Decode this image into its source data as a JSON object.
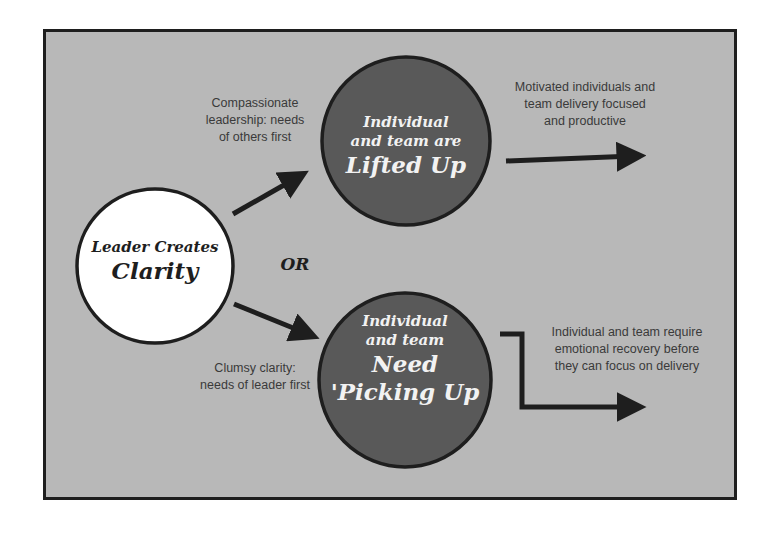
{
  "diagram": {
    "background_color": "#b8b8b8",
    "border_color": "#1e1e1e",
    "node_dark_color": "#5a5a5a",
    "node_light_color": "#ffffff",
    "source_node": {
      "line1": "Leader Creates",
      "line2": "Clarity"
    },
    "separator": "OR",
    "top_branch": {
      "edge_label_line1": "Compassionate",
      "edge_label_line2": "leadership: needs",
      "edge_label_line3": "of others first",
      "node_line1": "Individual",
      "node_line2": "and team are",
      "node_line3": "Lifted Up",
      "outcome_line1": "Motivated individuals and",
      "outcome_line2": "team delivery focused",
      "outcome_line3": "and productive"
    },
    "bottom_branch": {
      "edge_label_line1": "Clumsy clarity:",
      "edge_label_line2": "needs of leader first",
      "node_line1": "Individual",
      "node_line2": "and team",
      "node_line3": "Need",
      "node_line4": "'Picking Up",
      "outcome_line1": "Individual and team require",
      "outcome_line2": "emotional recovery before",
      "outcome_line3": "they can focus on delivery"
    }
  }
}
